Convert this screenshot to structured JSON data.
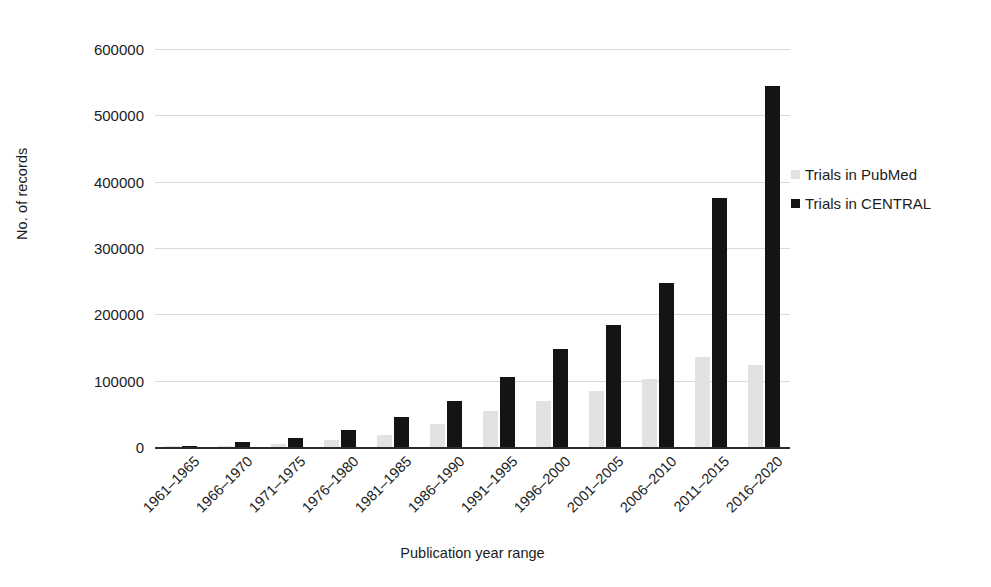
{
  "chart_data": {
    "type": "bar",
    "title": "",
    "xlabel": "Publication year range",
    "ylabel": "No. of records",
    "ylim": [
      0,
      600000
    ],
    "ytick_step": 100000,
    "yticks": [
      0,
      100000,
      200000,
      300000,
      400000,
      500000,
      600000
    ],
    "ytick_labels": [
      "0",
      "100000",
      "200000",
      "300000",
      "400000",
      "500000",
      "600000"
    ],
    "grid": true,
    "legend_position": "right",
    "categories": [
      "1961–1965",
      "1966–1970",
      "1971–1975",
      "1976–1980",
      "1981–1985",
      "1986–1990",
      "1991–1995",
      "1996–2000",
      "2001–2005",
      "2006–2010",
      "2011–2015",
      "2016–2020"
    ],
    "series": [
      {
        "name": "Trials in PubMed",
        "color": "#e2e2e2",
        "values": [
          300,
          1500,
          5000,
          11000,
          18000,
          35000,
          54000,
          70000,
          84000,
          103000,
          135000,
          124000
        ]
      },
      {
        "name": "Trials in CENTRAL",
        "color": "#141414",
        "values": [
          1500,
          7000,
          14000,
          26000,
          45000,
          70000,
          105000,
          148000,
          184000,
          248000,
          375000,
          544000
        ]
      }
    ]
  },
  "legend": {
    "items": [
      {
        "label": "Trials in PubMed",
        "color": "#e2e2e2"
      },
      {
        "label": "Trials in CENTRAL",
        "color": "#141414"
      }
    ]
  }
}
